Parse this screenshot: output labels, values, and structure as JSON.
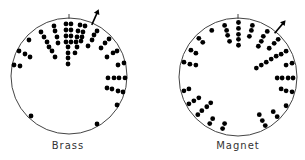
{
  "figure": {
    "panels": [
      {
        "id": "brass",
        "label": "Brass",
        "dot_color": "#000000",
        "circle_color": "#444444",
        "arrow_direction_deg": 24,
        "dots_unit": [
          [
            -0.259,
            -0.862
          ],
          [
            -0.241,
            -0.776
          ],
          [
            -0.207,
            -0.672
          ],
          [
            -0.19,
            -0.569
          ],
          [
            -0.483,
            -0.759
          ],
          [
            -0.431,
            -0.672
          ],
          [
            -0.379,
            -0.586
          ],
          [
            -0.345,
            -0.5
          ],
          [
            -0.293,
            -0.431
          ],
          [
            -0.241,
            -0.328
          ],
          [
            -0.052,
            -0.897
          ],
          [
            0.034,
            -0.897
          ],
          [
            -0.052,
            -0.793
          ],
          [
            0.034,
            -0.793
          ],
          [
            -0.052,
            -0.69
          ],
          [
            0.034,
            -0.69
          ],
          [
            -0.052,
            -0.586
          ],
          [
            0.034,
            -0.586
          ],
          [
            -0.017,
            -0.5
          ],
          [
            -0.017,
            -0.397
          ],
          [
            -0.017,
            -0.31
          ],
          [
            -0.017,
            -0.207
          ],
          [
            0.19,
            -0.879
          ],
          [
            0.276,
            -0.862
          ],
          [
            0.155,
            -0.776
          ],
          [
            0.241,
            -0.759
          ],
          [
            0.138,
            -0.672
          ],
          [
            0.224,
            -0.672
          ],
          [
            0.121,
            -0.586
          ],
          [
            0.207,
            -0.603
          ],
          [
            0.103,
            -0.397
          ],
          [
            0.138,
            -0.5
          ],
          [
            0.483,
            -0.776
          ],
          [
            0.431,
            -0.707
          ],
          [
            0.397,
            -0.621
          ],
          [
            0.328,
            -0.517
          ],
          [
            0.69,
            -0.638
          ],
          [
            0.621,
            -0.569
          ],
          [
            0.552,
            -0.483
          ],
          [
            0.828,
            -0.431
          ],
          [
            0.759,
            -0.397
          ],
          [
            0.655,
            -0.328
          ],
          [
            0.948,
            -0.224
          ],
          [
            0.845,
            -0.19
          ],
          [
            0.966,
            0.034
          ],
          [
            0.862,
            0.034
          ],
          [
            0.776,
            0.034
          ],
          [
            0.672,
            0.034
          ],
          [
            0.931,
            0.276
          ],
          [
            0.845,
            0.259
          ],
          [
            0.741,
            0.224
          ],
          [
            0.655,
            0.207
          ],
          [
            0.828,
            0.5
          ],
          [
            0.483,
            0.828
          ],
          [
            -0.655,
            0.69
          ],
          [
            -0.69,
            -0.621
          ],
          [
            -0.862,
            -0.431
          ],
          [
            -0.759,
            -0.379
          ],
          [
            -0.672,
            -0.328
          ],
          [
            -0.948,
            -0.19
          ],
          [
            -0.845,
            -0.172
          ]
        ]
      },
      {
        "id": "magnet",
        "label": "Magnet",
        "dot_color": "#000000",
        "circle_color": "#444444",
        "arrow_direction_deg": 40,
        "dots_unit": [
          [
            0.008,
            -0.924
          ],
          [
            0.008,
            -0.824
          ],
          [
            0.008,
            -0.723
          ],
          [
            0.008,
            -0.639
          ],
          [
            0.008,
            -0.538
          ],
          [
            -0.227,
            -0.874
          ],
          [
            -0.193,
            -0.79
          ],
          [
            -0.176,
            -0.706
          ],
          [
            -0.143,
            -0.605
          ],
          [
            0.244,
            -0.874
          ],
          [
            0.227,
            -0.79
          ],
          [
            0.193,
            -0.689
          ],
          [
            -0.445,
            -0.79
          ],
          [
            0.496,
            -0.773
          ],
          [
            0.429,
            -0.689
          ],
          [
            0.395,
            -0.605
          ],
          [
            0.345,
            -0.521
          ],
          [
            0.681,
            -0.639
          ],
          [
            0.613,
            -0.571
          ],
          [
            0.529,
            -0.487
          ],
          [
            0.815,
            -0.437
          ],
          [
            0.731,
            -0.387
          ],
          [
            0.647,
            -0.353
          ],
          [
            0.563,
            -0.303
          ],
          [
            0.479,
            -0.252
          ],
          [
            0.395,
            -0.202
          ],
          [
            0.311,
            -0.151
          ],
          [
            0.916,
            -0.235
          ],
          [
            0.815,
            -0.202
          ],
          [
            0.933,
            0.017
          ],
          [
            0.849,
            0.017
          ],
          [
            0.748,
            0.017
          ],
          [
            0.664,
            0.017
          ],
          [
            0.916,
            0.252
          ],
          [
            0.815,
            0.235
          ],
          [
            0.731,
            0.202
          ],
          [
            0.815,
            0.487
          ],
          [
            0.664,
            0.672
          ],
          [
            0.597,
            0.588
          ],
          [
            0.462,
            0.824
          ],
          [
            0.412,
            0.739
          ],
          [
            0.361,
            0.639
          ],
          [
            -0.227,
            0.79
          ],
          [
            -0.261,
            0.874
          ],
          [
            -0.429,
            0.706
          ],
          [
            -0.479,
            0.79
          ],
          [
            -0.462,
            0.437
          ],
          [
            -0.529,
            0.504
          ],
          [
            -0.613,
            0.571
          ],
          [
            -0.681,
            0.639
          ],
          [
            -0.664,
            0.353
          ],
          [
            -0.748,
            0.403
          ],
          [
            -0.832,
            0.454
          ],
          [
            -0.832,
            0.202
          ],
          [
            -0.916,
            0.235
          ],
          [
            -0.916,
            -0.252
          ],
          [
            -0.815,
            -0.218
          ],
          [
            -0.714,
            -0.202
          ],
          [
            -0.798,
            -0.454
          ],
          [
            -0.714,
            -0.403
          ],
          [
            -0.664,
            -0.655
          ],
          [
            -0.597,
            -0.588
          ]
        ]
      }
    ]
  }
}
